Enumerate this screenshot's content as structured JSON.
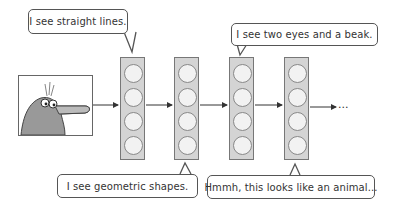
{
  "diagram": {
    "title": "",
    "input_image": {
      "subject": "cartoon platypus-like animal"
    },
    "layers": [
      {
        "id": "layer-1",
        "neurons": 4
      },
      {
        "id": "layer-2",
        "neurons": 4
      },
      {
        "id": "layer-3",
        "neurons": 4
      },
      {
        "id": "layer-4",
        "neurons": 4
      }
    ],
    "continuation": "...",
    "bubbles": [
      {
        "attached_to": "layer-1",
        "position": "top",
        "text": "I see straight lines."
      },
      {
        "attached_to": "layer-2",
        "position": "bottom",
        "text": "I see geometric shapes."
      },
      {
        "attached_to": "layer-3",
        "position": "top",
        "text": "I see two eyes and a beak."
      },
      {
        "attached_to": "layer-4",
        "position": "bottom",
        "text": "Hmmh, this looks like an animal..."
      }
    ],
    "colors": {
      "layer_fill": "#d4d4d4",
      "neuron_fill": "#f2f2f2",
      "stroke": "#555555"
    }
  }
}
